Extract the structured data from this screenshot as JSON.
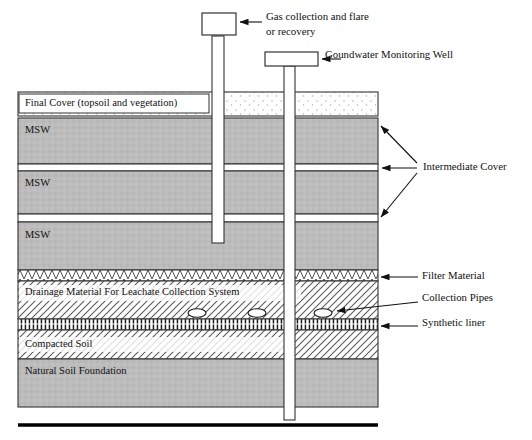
{
  "diagram": {
    "background": "#ffffff",
    "outline_color": "#333333",
    "msw_fill": "#b9b9b9",
    "soil_fill": "#b9b9b9",
    "hatch_color": "#555555"
  },
  "structures": {
    "gas_well": {
      "label_line1": "Gas collection and flare",
      "label_line2": "or recovery",
      "icon": "gas-flare-box"
    },
    "monitoring_well": {
      "label": "Goundwater Monitoring Well",
      "icon": "well-head-box"
    }
  },
  "layers": [
    {
      "key": "final_cover",
      "label": "Final Cover (topsoil and vegetation)",
      "pattern": "dotted"
    },
    {
      "key": "msw_1",
      "label": "MSW",
      "pattern": "solid-gray"
    },
    {
      "key": "msw_2",
      "label": "MSW",
      "pattern": "solid-gray"
    },
    {
      "key": "msw_3",
      "label": "MSW",
      "pattern": "solid-gray"
    },
    {
      "key": "filter",
      "label": "",
      "pattern": "zigzag"
    },
    {
      "key": "drainage",
      "label": "Drainage Material For Leachate Collection System",
      "pattern": "diagonal-hatch"
    },
    {
      "key": "liner",
      "label": "",
      "pattern": "vertical-ticks"
    },
    {
      "key": "compacted",
      "label": "Compacted Soil",
      "pattern": "diagonal-hatch"
    },
    {
      "key": "foundation",
      "label": "Natural Soil Foundation",
      "pattern": "solid-gray"
    }
  ],
  "callouts": [
    {
      "key": "intermediate_cover",
      "label": "Intermediate Cover",
      "arrows": 3
    },
    {
      "key": "filter_material",
      "label": "Filter Material",
      "arrows": 1
    },
    {
      "key": "collection_pipes",
      "label": "Collection Pipes",
      "arrows": 1
    },
    {
      "key": "synthetic_liner",
      "label": "Synthetic liner",
      "arrows": 1
    }
  ],
  "collection_pipes": {
    "count": 3,
    "shape": "ellipse"
  }
}
